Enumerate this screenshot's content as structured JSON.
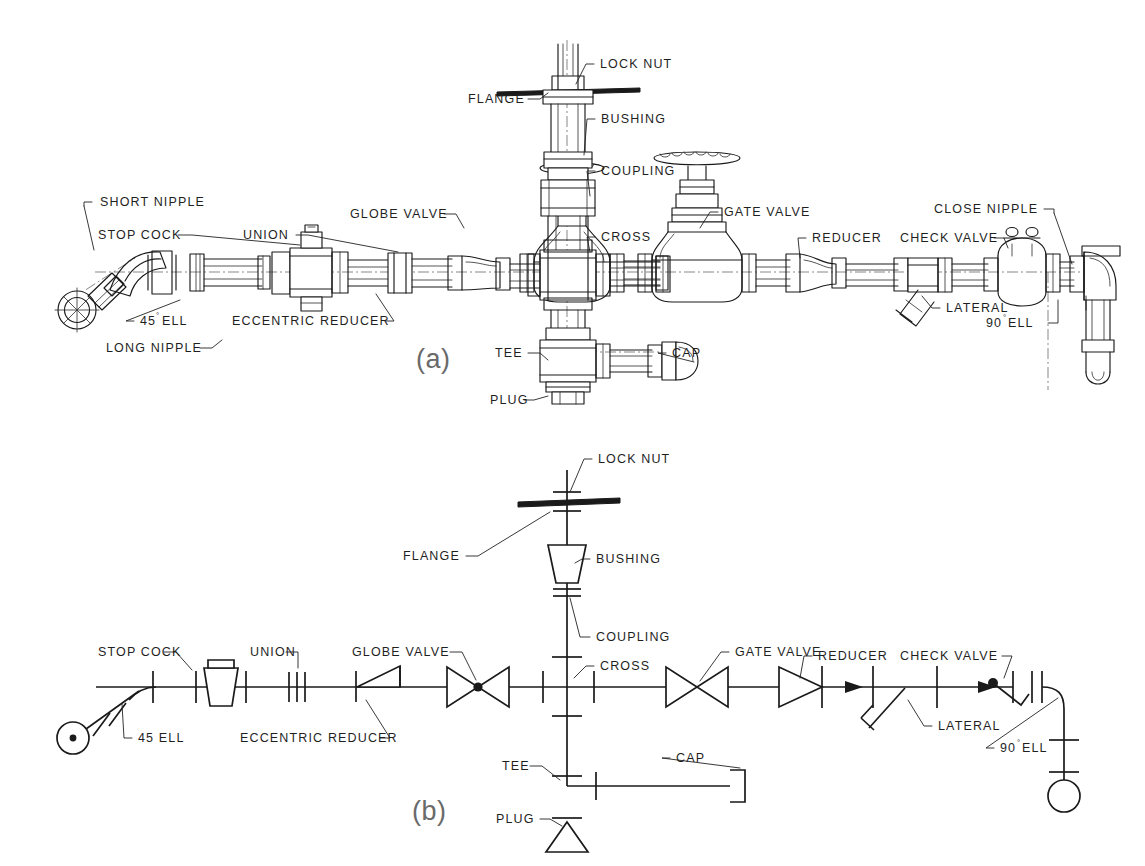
{
  "figure": {
    "background_color": "#ffffff",
    "line_color": "#1a1a1a",
    "text_color": "#1f1f1f",
    "caption_color": "#6a6a6a"
  },
  "panel_a": {
    "caption": "(a)",
    "labels": {
      "short_nipple": "SHORT NIPPLE",
      "stop_cock": "STOP COCK",
      "union": "UNION",
      "ell_45": "45",
      "ell_45_deg": "°",
      "ell_45_tail": "ELL",
      "long_nipple": "LONG NIPPLE",
      "eccentric_reducer": "ECCENTRIC REDUCER",
      "globe_valve": "GLOBE VALVE",
      "flange": "FLANGE",
      "lock_nut": "LOCK NUT",
      "bushing": "BUSHING",
      "coupling": "COUPLING",
      "cross": "CROSS",
      "gate_valve": "GATE VALVE",
      "reducer": "REDUCER",
      "check_valve": "CHECK VALVE",
      "close_nipple": "CLOSE NIPPLE",
      "lateral": "LATERAL",
      "ell_90": "90",
      "ell_90_deg": "°",
      "ell_90_tail": "ELL",
      "tee": "TEE",
      "cap": "CAP",
      "plug": "PLUG"
    }
  },
  "panel_b": {
    "caption": "(b)",
    "labels": {
      "stop_cock": "STOP COCK",
      "union": "UNION",
      "ell_45": "45 ELL",
      "eccentric_reducer": "ECCENTRIC REDUCER",
      "globe_valve": "GLOBE VALVE",
      "flange": "FLANGE",
      "lock_nut": "LOCK NUT",
      "bushing": "BUSHING",
      "coupling": "COUPLING",
      "cross": "CROSS",
      "gate_valve": "GATE VALVE",
      "reducer": "REDUCER",
      "check_valve": "CHECK VALVE",
      "lateral": "LATERAL",
      "ell_90": "90",
      "ell_90_deg": "°",
      "ell_90_tail": "ELL",
      "tee": "TEE",
      "cap": "CAP",
      "plug": "PLUG"
    }
  }
}
